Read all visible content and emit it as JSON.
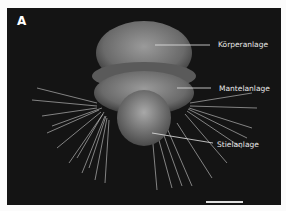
{
  "figure": {
    "panel_label": "A",
    "labels": [
      {
        "text": "Körperanlage"
      },
      {
        "text": "Mantelanlage"
      },
      {
        "text": "Stielanlage"
      }
    ],
    "scale_bar": "scale-bar"
  }
}
